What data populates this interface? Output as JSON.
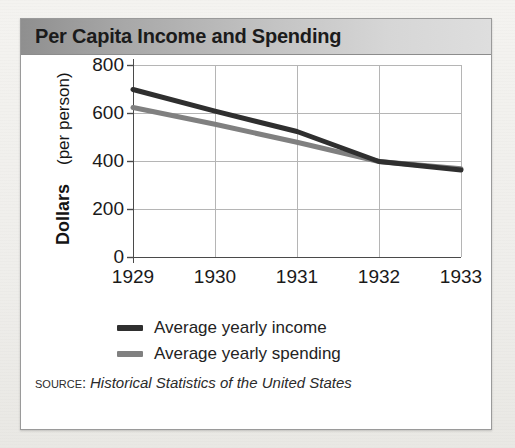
{
  "card": {
    "title": "Per Capita Income and Spending"
  },
  "source": {
    "label": "Source:",
    "title": "Historical Statistics of the United States"
  },
  "legend": [
    {
      "label": "Average yearly income",
      "color": "#2f2f2f",
      "swatch_name": "legend-swatch-income"
    },
    {
      "label": "Average yearly spending",
      "color": "#808080",
      "swatch_name": "legend-swatch-spending"
    }
  ],
  "chart_data": {
    "type": "line",
    "title": "Per Capita Income and Spending",
    "xlabel": "",
    "ylabel": "Dollars (per person)",
    "ylabel_bold_part": "Dollars",
    "ylabel_regular_part": "(per person)",
    "x": [
      "1929",
      "1930",
      "1931",
      "1932",
      "1933"
    ],
    "xtick_labels": [
      "1929",
      "1930",
      "1931",
      "1932",
      "1933"
    ],
    "ytick_labels": [
      "800",
      "600",
      "400",
      "200",
      "0"
    ],
    "yticks": [
      800,
      600,
      400,
      200,
      0
    ],
    "ylim": [
      0,
      800
    ],
    "grid": true,
    "legend_position": "below",
    "series": [
      {
        "name": "Average yearly income",
        "color": "#2f2f2f",
        "values": [
          700,
          610,
          525,
          400,
          365
        ]
      },
      {
        "name": "Average yearly spending",
        "color": "#808080",
        "values": [
          625,
          555,
          480,
          400,
          370
        ]
      }
    ]
  }
}
